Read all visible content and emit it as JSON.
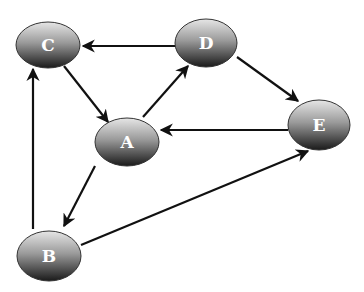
{
  "diagram": {
    "type": "directed-graph",
    "nodes": [
      {
        "id": "A",
        "label": "A",
        "cx": 127,
        "cy": 142,
        "rx": 32,
        "ry": 24
      },
      {
        "id": "B",
        "label": "B",
        "cx": 49,
        "cy": 256,
        "rx": 32,
        "ry": 25
      },
      {
        "id": "C",
        "label": "C",
        "cx": 48,
        "cy": 45,
        "rx": 32,
        "ry": 23
      },
      {
        "id": "D",
        "label": "D",
        "cx": 206,
        "cy": 43,
        "rx": 31,
        "ry": 24
      },
      {
        "id": "E",
        "label": "E",
        "cx": 319,
        "cy": 125,
        "rx": 31,
        "ry": 25
      }
    ],
    "edges": [
      {
        "from": "D",
        "to": "C",
        "x1": 175,
        "y1": 46,
        "x2": 83,
        "y2": 46
      },
      {
        "from": "C",
        "to": "A",
        "x1": 64,
        "y1": 66,
        "x2": 108,
        "y2": 122
      },
      {
        "from": "A",
        "to": "D",
        "x1": 143,
        "y1": 117,
        "x2": 188,
        "y2": 66
      },
      {
        "from": "D",
        "to": "E",
        "x1": 237,
        "y1": 57,
        "x2": 298,
        "y2": 101
      },
      {
        "from": "E",
        "to": "A",
        "x1": 288,
        "y1": 130,
        "x2": 161,
        "y2": 130
      },
      {
        "from": "A",
        "to": "B",
        "x1": 95,
        "y1": 166,
        "x2": 64,
        "y2": 226
      },
      {
        "from": "B",
        "to": "C",
        "x1": 33,
        "y1": 229,
        "x2": 33,
        "y2": 69
      },
      {
        "from": "B",
        "to": "E",
        "x1": 81,
        "y1": 245,
        "x2": 308,
        "y2": 151
      }
    ],
    "colors": {
      "node_top": "#d9d9d9",
      "node_bottom": "#1e1e1e",
      "node_stroke": "#333333",
      "edge": "#111111",
      "label": "#ffffff"
    }
  }
}
